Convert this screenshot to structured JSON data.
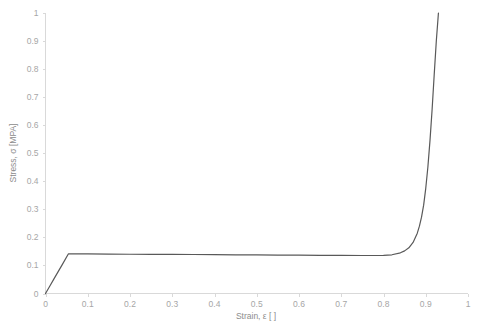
{
  "chart_data": {
    "type": "line",
    "title": "",
    "xlabel": "Strain, ε [ ]",
    "ylabel": "Stress, σ [MPA]",
    "xlim": [
      0,
      1
    ],
    "ylim": [
      0,
      1
    ],
    "grid": false,
    "legend": null,
    "xticks": [
      "0",
      "0.1",
      "0.2",
      "0.3",
      "0.4",
      "0.5",
      "0.6",
      "0.7",
      "0.8",
      "0.9",
      "1"
    ],
    "xtick_values": [
      0,
      0.1,
      0.2,
      0.3,
      0.4,
      0.5,
      0.6,
      0.7,
      0.8,
      0.9,
      1
    ],
    "yticks": [
      "0",
      "0.1",
      "0.2",
      "0.3",
      "0.4",
      "0.5",
      "0.6",
      "0.7",
      "0.8",
      "0.9",
      "1"
    ],
    "ytick_values": [
      0,
      0.1,
      0.2,
      0.3,
      0.4,
      0.5,
      0.6,
      0.7,
      0.8,
      0.9,
      1
    ],
    "series": [
      {
        "name": "stress-strain",
        "color": "#595959",
        "x": [
          0,
          0.01,
          0.02,
          0.03,
          0.04,
          0.054,
          0.1,
          0.15,
          0.2,
          0.25,
          0.3,
          0.35,
          0.4,
          0.45,
          0.5,
          0.55,
          0.6,
          0.65,
          0.7,
          0.75,
          0.78,
          0.8,
          0.82,
          0.84,
          0.85,
          0.86,
          0.87,
          0.88,
          0.885,
          0.89,
          0.895,
          0.9,
          0.905,
          0.91,
          0.915,
          0.92,
          0.925,
          0.93
        ],
        "y": [
          0,
          0.026,
          0.052,
          0.078,
          0.104,
          0.141,
          0.141,
          0.1405,
          0.14,
          0.1398,
          0.1395,
          0.139,
          0.1385,
          0.138,
          0.1375,
          0.137,
          0.1365,
          0.136,
          0.1358,
          0.1355,
          0.1355,
          0.136,
          0.138,
          0.145,
          0.152,
          0.163,
          0.182,
          0.215,
          0.24,
          0.272,
          0.315,
          0.375,
          0.45,
          0.545,
          0.655,
          0.78,
          0.9,
          1.0
        ]
      }
    ]
  },
  "axis": {
    "x_title": "Strain, ε [ ]",
    "y_title": "Stress, σ [MPA]"
  }
}
